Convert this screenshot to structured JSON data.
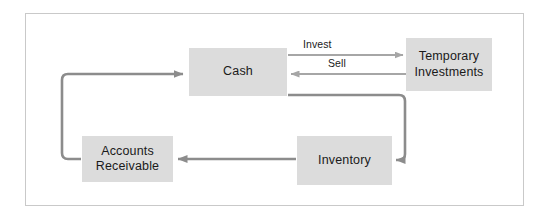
{
  "diagram": {
    "frame": {
      "stroke": "#c9c9c9"
    },
    "colors": {
      "box_fill": "#dcdcdc",
      "text": "#1a1a1a",
      "arrow_light": "#a6a6a6",
      "arrow_dark": "#8c8c8c"
    },
    "nodes": [
      {
        "id": "cash",
        "label": "Cash",
        "x": 189,
        "y": 48,
        "w": 98,
        "h": 48
      },
      {
        "id": "temporary-investments",
        "label": "Temporary\nInvestments",
        "x": 406,
        "y": 38,
        "w": 86,
        "h": 53
      },
      {
        "id": "inventory",
        "label": "Inventory",
        "x": 297,
        "y": 136,
        "w": 95,
        "h": 49
      },
      {
        "id": "accounts-receivable",
        "label": "Accounts\nReceivable",
        "x": 82,
        "y": 136,
        "w": 91,
        "h": 46
      }
    ],
    "edges": [
      {
        "id": "invest",
        "label": "Invest",
        "from": "cash",
        "to": "temporary-investments",
        "direction": "right",
        "label_x": 300,
        "label_y": 38
      },
      {
        "id": "sell",
        "label": "Sell",
        "from": "temporary-investments",
        "to": "cash",
        "direction": "left",
        "label_x": 325,
        "label_y": 57
      },
      {
        "id": "cash-to-inventory",
        "label": "",
        "from": "cash",
        "to": "inventory",
        "direction": "left"
      },
      {
        "id": "inventory-to-accounts-receivable",
        "label": "",
        "from": "inventory",
        "to": "accounts-receivable",
        "direction": "left"
      },
      {
        "id": "accounts-receivable-to-cash",
        "label": "",
        "from": "accounts-receivable",
        "to": "cash",
        "direction": "right"
      }
    ]
  }
}
